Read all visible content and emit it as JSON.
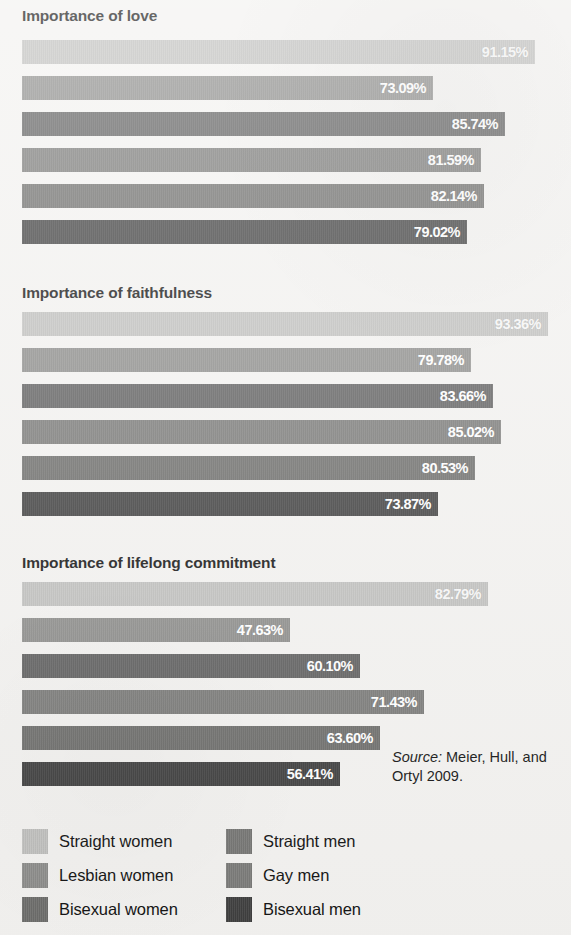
{
  "chart_data": {
    "type": "bar",
    "orientation": "horizontal",
    "title": "",
    "xlabel": "",
    "ylabel": "",
    "xlim": [
      0,
      100
    ],
    "value_suffix": "%",
    "grid": false,
    "legend_position": "bottom",
    "categories": [
      "Straight women",
      "Lesbian women",
      "Bisexual women",
      "Straight men",
      "Gay men",
      "Bisexual men"
    ],
    "series_order_in_panel": [
      "Straight women",
      "Straight men",
      "Lesbian women",
      "Gay men",
      "Bisexual women",
      "Bisexual men"
    ],
    "panels": [
      {
        "title": "Importance of love",
        "bars": [
          {
            "category": "Straight women",
            "value": 91.15,
            "label": "91.15%",
            "color": "#c2c2c0"
          },
          {
            "category": "Straight men",
            "value": 73.09,
            "label": "73.09%",
            "color": "#8e8e8c"
          },
          {
            "category": "Lesbian women",
            "value": 85.74,
            "label": "85.74%",
            "color": "#606060"
          },
          {
            "category": "Gay men",
            "value": 81.59,
            "label": "81.59%",
            "color": "#7b7b79"
          },
          {
            "category": "Bisexual women",
            "value": 82.14,
            "label": "82.14%",
            "color": "#6e6e6c"
          },
          {
            "category": "Bisexual men",
            "value": 79.02,
            "label": "79.02%",
            "color": "#3f3f3f"
          }
        ]
      },
      {
        "title": "Importance of faithfulness",
        "bars": [
          {
            "category": "Straight women",
            "value": 93.36,
            "label": "93.36%",
            "color": "#c2c2c0"
          },
          {
            "category": "Straight men",
            "value": 79.78,
            "label": "79.78%",
            "color": "#8e8e8c"
          },
          {
            "category": "Lesbian women",
            "value": 83.66,
            "label": "83.66%",
            "color": "#606060"
          },
          {
            "category": "Gay men",
            "value": 85.02,
            "label": "85.02%",
            "color": "#7b7b79"
          },
          {
            "category": "Bisexual women",
            "value": 80.53,
            "label": "80.53%",
            "color": "#6e6e6c"
          },
          {
            "category": "Bisexual men",
            "value": 73.87,
            "label": "73.87%",
            "color": "#3f3f3f"
          }
        ]
      },
      {
        "title": "Importance of lifelong commitment",
        "bars": [
          {
            "category": "Straight women",
            "value": 82.79,
            "label": "82.79%",
            "color": "#c2c2c0"
          },
          {
            "category": "Straight men",
            "value": 47.63,
            "label": "47.63%",
            "color": "#8e8e8c"
          },
          {
            "category": "Lesbian women",
            "value": 60.1,
            "label": "60.10%",
            "color": "#606060"
          },
          {
            "category": "Gay men",
            "value": 71.43,
            "label": "71.43%",
            "color": "#7b7b79"
          },
          {
            "category": "Bisexual women",
            "value": 63.6,
            "label": "63.60%",
            "color": "#6e6e6c"
          },
          {
            "category": "Bisexual men",
            "value": 56.41,
            "label": "56.41%",
            "color": "#3f3f3f"
          }
        ]
      }
    ],
    "legend": {
      "left_column": [
        {
          "label": "Straight women",
          "color": "#c2c2c0"
        },
        {
          "label": "Lesbian women",
          "color": "#8e8e8c"
        },
        {
          "label": "Bisexual women",
          "color": "#6e6e6c"
        }
      ],
      "right_column": [
        {
          "label": "Straight men",
          "color": "#767674"
        },
        {
          "label": "Gay men",
          "color": "#7b7b79"
        },
        {
          "label": "Bisexual men",
          "color": "#3f3f3f"
        }
      ]
    },
    "source": {
      "label": "Source:",
      "text": "Meier, Hull, and Ortyl 2009."
    },
    "axis_scale_px_per_percent": 5.63,
    "bar_origin_x_px": 22,
    "max_value": 93.36
  }
}
